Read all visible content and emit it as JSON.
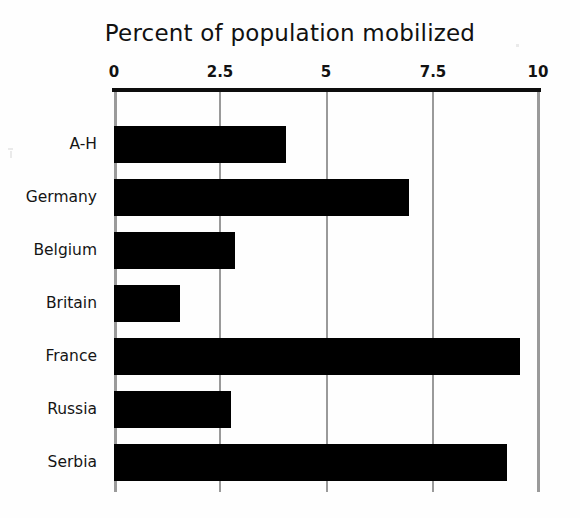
{
  "chart_data": {
    "type": "bar",
    "orientation": "horizontal",
    "title": "Percent of population mobilized",
    "xlabel": "",
    "ylabel": "",
    "categories": [
      "A-H",
      "Germany",
      "Belgium",
      "Britain",
      "France",
      "Russia",
      "Serbia"
    ],
    "values": [
      4.05,
      6.95,
      2.85,
      1.55,
      9.55,
      2.75,
      9.25
    ],
    "series": [
      {
        "name": "Percent of population mobilized",
        "values": [
          4.05,
          6.95,
          2.85,
          1.55,
          9.55,
          2.75,
          9.25
        ]
      }
    ],
    "xlim": [
      0,
      10
    ],
    "xticks": [
      0,
      2.5,
      5,
      7.5,
      10
    ],
    "xtick_labels": [
      "0",
      "2.5",
      "5",
      "7.5",
      "10"
    ],
    "grid": "vertical",
    "legend": "none",
    "bar_color": "#000000",
    "gridline_color": "#9a9a9a",
    "axis_color": "#0d0d0d",
    "background_color": "#ffffff",
    "axis_position": "top"
  }
}
